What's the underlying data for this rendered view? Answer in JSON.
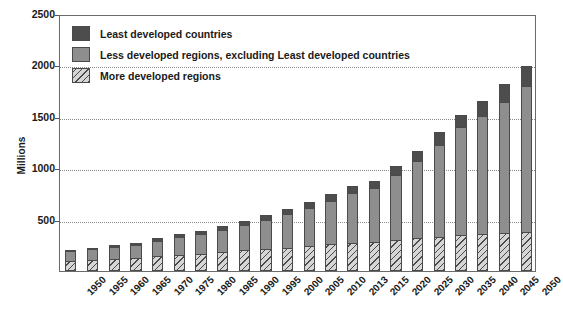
{
  "chart_data": {
    "type": "bar",
    "stacked": true,
    "title": "",
    "xlabel": "",
    "ylabel": "Millions",
    "ylim": [
      0,
      2500
    ],
    "ytick_labels": [
      "2500",
      "2000",
      "1500",
      "1000",
      "500"
    ],
    "yticks": [
      2500,
      2000,
      1500,
      1000,
      500
    ],
    "grid": true,
    "legend_position": "top-left",
    "categories": [
      "1950",
      "1955",
      "1960",
      "1965",
      "1970",
      "1975",
      "1980",
      "1985",
      "1990",
      "1995",
      "2000",
      "2005",
      "2010",
      "2013",
      "2015",
      "2020",
      "2025",
      "2030",
      "2035",
      "2040",
      "2045",
      "2050"
    ],
    "series": [
      {
        "name": "More developed regions",
        "color": "#d6d6d6",
        "pattern": "diagonal-hatch",
        "values": [
          95,
          105,
          115,
          125,
          145,
          160,
          170,
          185,
          200,
          210,
          225,
          240,
          260,
          275,
          285,
          300,
          320,
          335,
          350,
          360,
          370,
          375
        ]
      },
      {
        "name": "Less developed regions, excluding Least developed countries",
        "color": "#8e8e8e",
        "values": [
          95,
          105,
          115,
          130,
          150,
          170,
          190,
          215,
          245,
          290,
          330,
          370,
          425,
          480,
          520,
          635,
          750,
          890,
          1050,
          1150,
          1270,
          1420
        ]
      },
      {
        "name": "Least developed countries",
        "color": "#4d4d4d",
        "values": [
          15,
          17,
          19,
          21,
          25,
          28,
          32,
          36,
          40,
          45,
          52,
          58,
          65,
          70,
          75,
          85,
          100,
          125,
          115,
          145,
          180,
          200
        ]
      }
    ],
    "totals": [
      205,
      227,
      249,
      276,
      320,
      358,
      392,
      436,
      485,
      545,
      607,
      668,
      750,
      825,
      880,
      1020,
      1170,
      1350,
      1515,
      1655,
      1820,
      1995
    ]
  },
  "legend": {
    "items": [
      {
        "label": "Least developed countries",
        "swatch": "least"
      },
      {
        "label": "Less developed regions, excluding Least developed countries",
        "swatch": "less"
      },
      {
        "label": "More developed regions",
        "swatch": "more"
      }
    ]
  },
  "axes": {
    "y_title": "Millions"
  }
}
